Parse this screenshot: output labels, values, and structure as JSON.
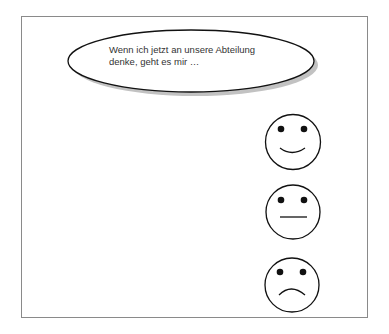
{
  "speech_bubble": {
    "line1": "Wenn ich jetzt an unsere Abteilung",
    "line2": "denke, geht es mir …"
  },
  "faces": [
    {
      "mood": "happy"
    },
    {
      "mood": "neutral"
    },
    {
      "mood": "sad"
    }
  ],
  "colors": {
    "stroke": "#111111",
    "shadow": "#9a9a9a",
    "frame": "#8a8a8a"
  }
}
